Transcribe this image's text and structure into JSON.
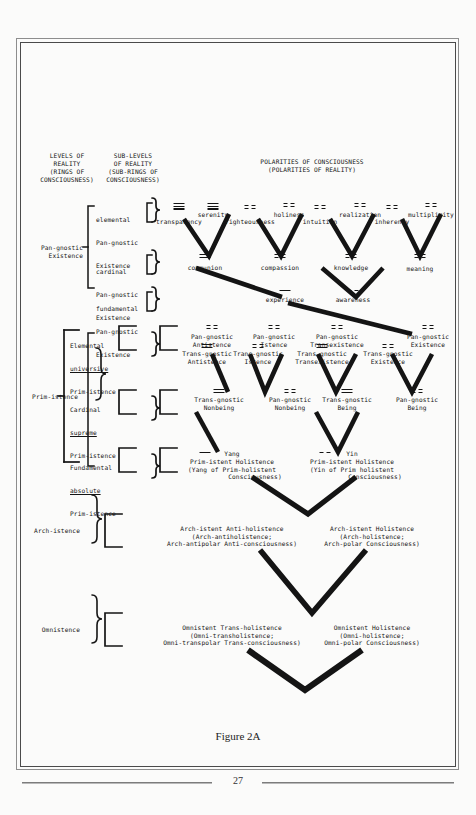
{
  "page": {
    "caption": "Figure 2A",
    "folio": "27"
  },
  "headers": {
    "levels": "LEVELS OF\nREALITY\n(RINGS OF\nCONSCIOUSNESS)",
    "sublevels": "SUB-LEVELS\nOF REALITY\n(SUB-RINGS OF\nCONSCIOUSNESS)",
    "polarities": "POLARITIES OF CONSCIOUSNESS\n(POLARITIES OF REALITY)"
  },
  "levels": [
    {
      "id": "pan-gnostic-existence",
      "label": "Pan-gnostic\nExistence"
    },
    {
      "id": "prim-istence",
      "label": "Prim-istence"
    },
    {
      "id": "arch-istence",
      "label": "Arch-istence"
    },
    {
      "id": "omnistence",
      "label": "Omnistence"
    }
  ],
  "sublevels": [
    {
      "id": "elemental-pan-gnostic-existence",
      "l1": "elemental",
      "l2": "Pan-gnostic",
      "l3": "Existence",
      "underline": false
    },
    {
      "id": "cardinal-pan-gnostic-existence",
      "l1": "cardinal",
      "l2": "Pan-gnostic",
      "l3": "Existence",
      "underline": false
    },
    {
      "id": "fundamental-pan-gnostic-existence",
      "l1": "fundamental",
      "l2": "Pan-gnostic",
      "l3": "Existence",
      "underline": false
    },
    {
      "id": "elemental-universive-prim-istence",
      "l1": "Elemental",
      "l2": "universive",
      "l3": "Prim-istence",
      "underline": true
    },
    {
      "id": "cardinal-supreme-prim-istence",
      "l1": "Cardinal",
      "l2": "supreme",
      "l3": "Prim-istence",
      "underline": true
    },
    {
      "id": "fundamental-absolute-prim-istence",
      "l1": "Fundamental",
      "l2": "absolute",
      "l3": "Prim-istence",
      "underline": true
    }
  ],
  "polarities": {
    "row_elemental_existence": [
      {
        "id": "transparency",
        "text": "transparency",
        "mark": "yang-yang-yang",
        "lines": [
          "s",
          "s",
          "s"
        ]
      },
      {
        "id": "serenity",
        "text": "serenity",
        "mark": "yang-yang-yang",
        "lines": [
          "s",
          "s",
          "s"
        ]
      },
      {
        "id": "righteousness",
        "text": "righteousness",
        "mark": "yin-yin",
        "lines": [
          "b",
          "b"
        ]
      },
      {
        "id": "holiness",
        "text": "holiness",
        "mark": "yin-yin",
        "lines": [
          "b",
          "b"
        ]
      },
      {
        "id": "intuition",
        "text": "intuition",
        "mark": "yin-yin",
        "lines": [
          "b",
          "b"
        ]
      },
      {
        "id": "realization",
        "text": "realization",
        "mark": "yin-yin",
        "lines": [
          "b",
          "b"
        ]
      },
      {
        "id": "inherency",
        "text": "inherency",
        "mark": "yin-yin",
        "lines": [
          "b",
          "b"
        ]
      },
      {
        "id": "multiplicity",
        "text": "multiplicity",
        "mark": "yin-yin",
        "lines": [
          "b",
          "b"
        ]
      }
    ],
    "row_cardinal_existence": [
      {
        "id": "communion",
        "text": "communion",
        "mark": "yang-yang",
        "lines": [
          "s",
          "s"
        ]
      },
      {
        "id": "compassion",
        "text": "compassion",
        "mark": "yin-yin",
        "lines": [
          "b",
          "b"
        ]
      },
      {
        "id": "knowledge",
        "text": "knowledge",
        "mark": "yin-yin",
        "lines": [
          "b",
          "b"
        ]
      },
      {
        "id": "meaning",
        "text": "meaning",
        "mark": "yin-yin",
        "lines": [
          "b",
          "b"
        ]
      }
    ],
    "row_fundamental_existence": [
      {
        "id": "experience",
        "text": "experience",
        "mark": "yang",
        "lines": [
          "s"
        ]
      },
      {
        "id": "awareness",
        "text": "awareness",
        "mark": "yin",
        "lines": [
          "b"
        ]
      }
    ],
    "row_elemental_prim": [
      {
        "id": "trans-gnostic-antistence",
        "text": "Trans-gnostic\nAntistence",
        "mark": "yang-yang",
        "lines": [
          "s",
          "s"
        ]
      },
      {
        "id": "pan-gnostic-antistence",
        "text": "Pan-gnostic\nAntistence",
        "mark": "yin-yin",
        "lines": [
          "b",
          "b"
        ]
      },
      {
        "id": "trans-gnostic-istence",
        "text": "Trans-gnostic\nIstence",
        "mark": "yin-yin",
        "lines": [
          "b",
          "b"
        ]
      },
      {
        "id": "pan-gnostic-istence",
        "text": "Pan-gnostic\nIstence",
        "mark": "yin-yin",
        "lines": [
          "b",
          "b"
        ]
      },
      {
        "id": "trans-gnostic-transexistence",
        "text": "Trans-gnostic\nTransexistence",
        "mark": "yang-yang",
        "lines": [
          "s",
          "s"
        ]
      },
      {
        "id": "pan-gnostic-transexistence",
        "text": "Pan-gnostic\nTransexistence",
        "mark": "yin-yin",
        "lines": [
          "b",
          "b"
        ]
      },
      {
        "id": "trans-gnostic-existence",
        "text": "Trans-gnostic\nExistence",
        "mark": "yin-yin",
        "lines": [
          "b",
          "b"
        ]
      },
      {
        "id": "pan-gnostic-existence-node",
        "text": "Pan-gnostic\nExistence",
        "mark": "yin-yin",
        "lines": [
          "b",
          "b"
        ]
      }
    ],
    "row_cardinal_prim": [
      {
        "id": "trans-gnostic-nonbeing",
        "text": "Trans-gnostic\nNonbeing",
        "mark": "yang-yang",
        "lines": [
          "s",
          "s"
        ]
      },
      {
        "id": "pan-gnostic-nonbeing",
        "text": "Pan-gnostic\nNonbeing",
        "mark": "yin-yin",
        "lines": [
          "b",
          "b"
        ]
      },
      {
        "id": "trans-gnostic-being",
        "text": "Trans-gnostic\nBeing",
        "mark": "yang-yang",
        "lines": [
          "s",
          "s"
        ]
      },
      {
        "id": "pan-gnostic-being",
        "text": "Pan-gnostic\nBeing",
        "mark": "yin-yin",
        "lines": [
          "b",
          "b"
        ]
      }
    ],
    "row_fundamental_prim": [
      {
        "id": "yang-prim-istent-holistence",
        "title": "Yang",
        "text": "Prim-istent Holistence\n(Yang of Prim-holistent\n            Consciousness)",
        "mark": "yang",
        "lines": [
          "s"
        ]
      },
      {
        "id": "yin-prim-istent-holistence",
        "title": "Yin",
        "text": "Prim-istent Holistence\n(Yin of Prim holistent\n            Consciousness)",
        "mark": "yin",
        "lines": [
          "b"
        ]
      }
    ],
    "row_arch": [
      {
        "id": "arch-istent-anti-holistence",
        "text": "Arch-istent Anti-holistence\n(Arch-antiholistence;\nArch-antipolar Anti-consciousness)"
      },
      {
        "id": "arch-istent-holistence",
        "text": "Arch-istent Holistence\n(Arch-holistence;\nArch-polar Consciousness)"
      }
    ],
    "row_omni": [
      {
        "id": "omnistent-trans-holistence",
        "text": "Omnistent Trans-holistence\n(Omni-transholistence;\nOmni-transpolar Trans-consciousness)"
      },
      {
        "id": "omnistent-holistence",
        "text": "Omnistent Holistence\n(Omni-holistence;\nOmni-polar Consciousness)"
      }
    ]
  },
  "colors": {
    "ink": "#141414",
    "paper": "#fbfbfa",
    "frame": "#4a4a4a"
  }
}
